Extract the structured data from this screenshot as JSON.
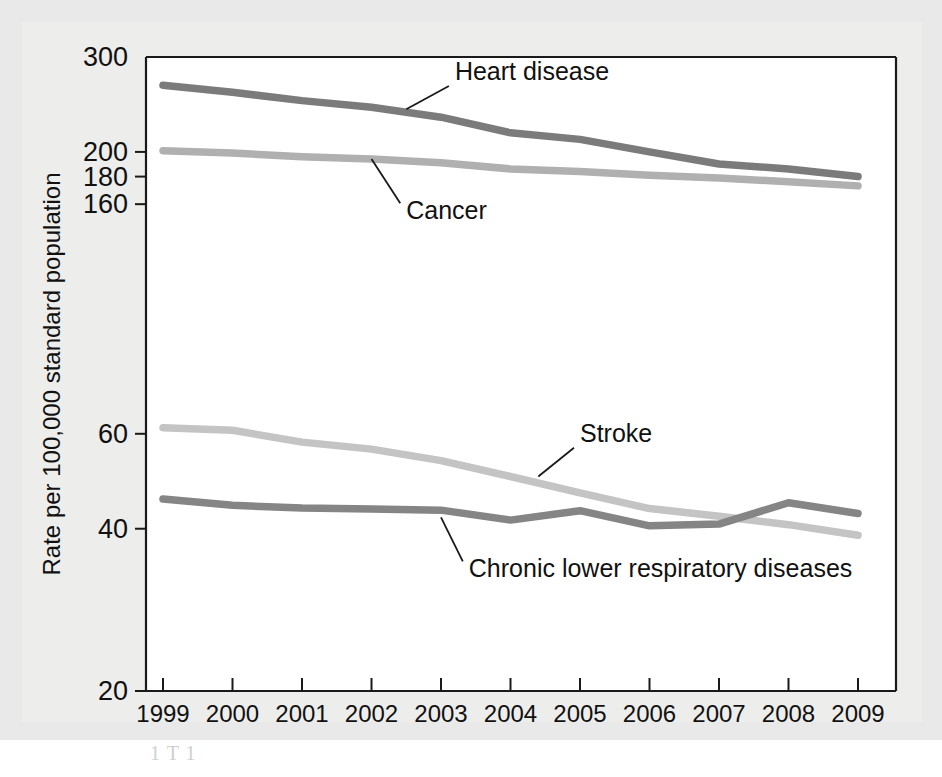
{
  "figure": {
    "background_color": "#ededec",
    "page_color": "#e9e9e9",
    "plot_background": "#ffffff",
    "axis_color": "#1a1a1a",
    "faint_caption": "1 T  1"
  },
  "chart_data": {
    "type": "line",
    "title": "",
    "subtitle": "",
    "xlabel": "",
    "ylabel": "Rate per 100,000 standard population",
    "x": [
      1999,
      2000,
      2001,
      2002,
      2003,
      2004,
      2005,
      2006,
      2007,
      2008,
      2009
    ],
    "xtick_labels": [
      "1999",
      "2000",
      "2001",
      "2002",
      "2003",
      "2004",
      "2005",
      "2006",
      "2007",
      "2008",
      "2009"
    ],
    "yscale": "log",
    "ylim": [
      20,
      300
    ],
    "ytick_values": [
      300,
      200,
      180,
      160,
      60,
      40,
      20
    ],
    "ytick_labels": [
      "300",
      "200",
      "180",
      "160",
      "60",
      "40",
      "20"
    ],
    "grid": false,
    "legend_position": "inline-annotations",
    "series": [
      {
        "name": "Heart disease",
        "color": "#7b7b7b",
        "values": [
          266,
          258,
          249,
          242,
          232,
          217,
          211,
          200,
          190,
          186,
          180
        ],
        "label_x": 2003.2,
        "label_y": 272,
        "leader_from_x": 2002.5,
        "leader_from_y": 240
      },
      {
        "name": "Cancer",
        "color": "#b0b0b0",
        "values": [
          201,
          199,
          196,
          194,
          191,
          186,
          184,
          181,
          179,
          176,
          173
        ],
        "label_x": 2002.5,
        "label_y": 150,
        "leader_from_x": 2002.0,
        "leader_from_y": 194
      },
      {
        "name": "Stroke",
        "color": "#c4c4c4",
        "values": [
          61.6,
          60.9,
          57.9,
          56.2,
          53.5,
          50.0,
          46.6,
          43.6,
          42.2,
          40.7,
          38.9
        ],
        "label_x": 2005.0,
        "label_y": 58,
        "leader_from_x": 2004.4,
        "leader_from_y": 50
      },
      {
        "name": "Chronic lower respiratory diseases",
        "color": "#858585",
        "values": [
          45.4,
          44.2,
          43.7,
          43.5,
          43.3,
          41.5,
          43.2,
          40.5,
          40.8,
          44.7,
          42.7
        ],
        "label_x": 2003.4,
        "label_y": 32.5,
        "leader_from_x": 2003.0,
        "leader_from_y": 42
      }
    ]
  }
}
